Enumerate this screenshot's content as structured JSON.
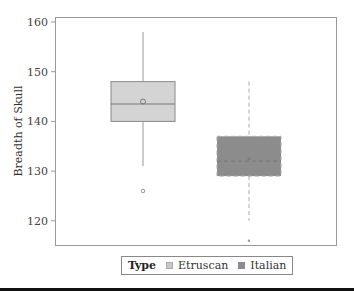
{
  "chart_data": {
    "type": "box",
    "title": "",
    "xlabel": "",
    "ylabel": "Breadth of Skull",
    "ylim": [
      115,
      161
    ],
    "yticks": [
      120,
      130,
      140,
      150,
      160
    ],
    "grid": false,
    "legend_position": "bottom",
    "legend_title": "Type",
    "categories": [
      "Etruscan",
      "Italian"
    ],
    "series": [
      {
        "name": "Etruscan",
        "whisker_low": 131,
        "q1": 140,
        "median": 143.5,
        "mean": 144,
        "q3": 148,
        "whisker_high": 158,
        "outliers": [
          126
        ],
        "fill": "#d4d4d4",
        "line_style": "solid"
      },
      {
        "name": "Italian",
        "whisker_low": 120,
        "q1": 129,
        "median": 132,
        "mean": 132.5,
        "q3": 137,
        "whisker_high": 148,
        "outliers": [
          116
        ],
        "fill": "#8c8c8c",
        "line_style": "dashed"
      }
    ]
  },
  "legend": {
    "title": "Type",
    "items": [
      {
        "label": "Etruscan",
        "color": "#c8c8c8"
      },
      {
        "label": "Italian",
        "color": "#8c8c8c"
      }
    ]
  },
  "axis": {
    "ylabel": "Breadth of Skull",
    "ytick_labels": [
      "160",
      "150",
      "140",
      "130",
      "120"
    ]
  }
}
